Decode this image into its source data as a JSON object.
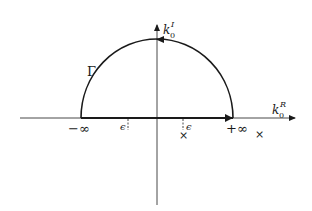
{
  "diagram": {
    "type": "contour-integration-plane",
    "axes": {
      "horizontal": {
        "label_base": "k",
        "label_sub": "0",
        "label_sup": "R"
      },
      "vertical": {
        "label_base": "k",
        "label_sub": "0",
        "label_sup": "I"
      }
    },
    "contour": {
      "label": "Γ",
      "shape": "upper semicircle closed along real axis",
      "orientation": "counterclockwise"
    },
    "real_axis_labels": {
      "left_infinity": "−∞",
      "right_infinity": "+∞",
      "left_epsilon": "ϵ",
      "right_epsilon": "ϵ"
    },
    "poles": [
      {
        "label": "×",
        "position": "below real axis near +ϵ"
      },
      {
        "label": "×",
        "position": "beyond +∞"
      }
    ],
    "colors": {
      "stroke": "#1a1a1a",
      "background": "#ffffff"
    }
  }
}
